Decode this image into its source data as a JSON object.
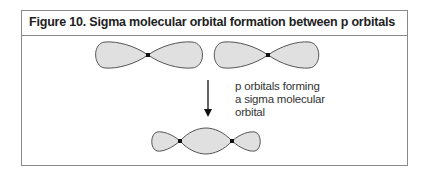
{
  "figure": {
    "title": "Figure 10. Sigma molecular orbital formation between p orbitals",
    "caption_lines": [
      "p orbitals forming",
      "a sigma molecular",
      "orbital"
    ]
  },
  "diagram": {
    "elements": [
      {
        "type": "p-orbital",
        "label": "left p orbital"
      },
      {
        "type": "p-orbital",
        "label": "right p orbital"
      },
      {
        "type": "arrow",
        "direction": "down"
      },
      {
        "type": "sigma-molecular-orbital",
        "label": "sigma molecular orbital"
      }
    ],
    "colors": {
      "lobe_fill": "#e0e0e0",
      "lobe_stroke": "#555555",
      "node": "#111111",
      "border": "#8a8a8a"
    }
  }
}
